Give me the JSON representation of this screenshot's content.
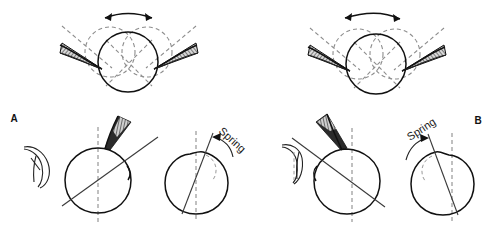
{
  "figure": {
    "background_color": "#ffffff",
    "width": 499,
    "height": 233,
    "ink_color": "#111111",
    "dashed_color": "#8d8d8d",
    "hatch_color": "#555555"
  },
  "panels": [
    {
      "id": "A",
      "label": "A",
      "label_position": {
        "x": 14,
        "y": 122
      },
      "side": "left",
      "mirror": false
    },
    {
      "id": "B",
      "label": "B",
      "label_position": {
        "x": 478,
        "y": 124
      },
      "side": "right",
      "mirror": true
    }
  ],
  "top_row": {
    "left_diagram": {
      "name": "bilateral-seta-rotation-left",
      "arrow": {
        "name": "double-headed-rotation-arrow",
        "type": "double-headed-curved",
        "direction": "bidirectional"
      },
      "main_circle": {
        "cx": 128,
        "cy": 62,
        "r": 30
      },
      "dashed_circles": [
        {
          "cx": 108,
          "cy": 50,
          "r": 26
        },
        {
          "cx": 148,
          "cy": 50,
          "r": 26
        }
      ],
      "cross_lines": 2,
      "setae": [
        {
          "name": "seta-left",
          "orientation": "left",
          "shaded": true
        },
        {
          "name": "seta-right",
          "orientation": "right",
          "shaded": true
        }
      ],
      "dashed_guides": 2
    },
    "right_diagram": {
      "name": "bilateral-seta-rotation-right",
      "arrow": {
        "name": "double-headed-rotation-arrow",
        "type": "double-headed-curved",
        "direction": "bidirectional"
      },
      "main_circle": {
        "cx": 376,
        "cy": 64,
        "r": 30
      },
      "dashed_circles": [
        {
          "cx": 356,
          "cy": 52,
          "r": 26
        },
        {
          "cx": 396,
          "cy": 52,
          "r": 26
        }
      ],
      "cross_lines": 2,
      "setae": [
        {
          "name": "seta-left",
          "orientation": "left",
          "shaded": true
        },
        {
          "name": "seta-right",
          "orientation": "right",
          "shaded": true
        }
      ],
      "dashed_guides": 2
    }
  },
  "bottom_row": {
    "panel_a": {
      "detached_seta": {
        "name": "detached-seta-hook",
        "shape": "curved-hook",
        "cx": 42,
        "cy": 165
      },
      "cell_left": {
        "name": "cell-with-attached-seta",
        "cx": 98,
        "cy": 180,
        "r": 33,
        "vertical_dashed_axis": true,
        "tilt_line": true,
        "seta_attached": true
      },
      "cell_right": {
        "name": "cell-with-spring-rotation",
        "cx": 196,
        "cy": 183,
        "r": 31,
        "vertical_dashed_axis": true,
        "tilt_line": true,
        "seta_attached": false,
        "dashed_bulge": true
      },
      "spring_label": {
        "name": "spring-label",
        "text": "Spring",
        "rotation_deg": 42,
        "x": 215,
        "y": 126,
        "arrow": {
          "name": "spring-curved-arrow",
          "type": "single-headed-curved",
          "direction": "counterclockwise-to-left"
        }
      }
    },
    "panel_b": {
      "detached_seta": {
        "name": "detached-seta-hook",
        "shape": "curved-hook",
        "cx": 300,
        "cy": 160
      },
      "cell_left": {
        "name": "cell-with-attached-seta",
        "cx": 347,
        "cy": 180,
        "r": 33,
        "vertical_dashed_axis": true,
        "tilt_line": true,
        "seta_attached": true
      },
      "cell_right": {
        "name": "cell-with-spring-rotation",
        "cx": 444,
        "cy": 183,
        "r": 31,
        "vertical_dashed_axis": true,
        "tilt_line": true,
        "seta_attached": false,
        "dashed_bulge": true
      },
      "spring_label": {
        "name": "spring-label",
        "text": "Spring",
        "rotation_deg": -33,
        "x": 414,
        "y": 134,
        "arrow": {
          "name": "spring-curved-arrow",
          "type": "single-headed-curved",
          "direction": "clockwise-to-right"
        }
      }
    }
  }
}
